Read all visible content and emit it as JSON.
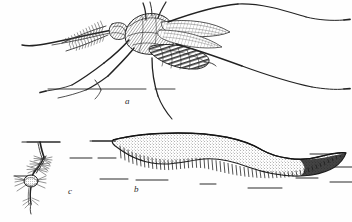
{
  "plate": {
    "title": "Mosquito life stages engraving plate",
    "background_color": "#fefefe",
    "ink_color": "#2b2b2b",
    "width": 352,
    "height": 222
  },
  "figures": [
    {
      "key": "a",
      "label": "a",
      "name": "adult-mosquito",
      "description": "Adult mosquito in side view with plumose antennae, long proboscis, banded abdomen, scaled wings and long trailing hind legs, resting on a surface line",
      "label_x": 125,
      "label_y": 97
    },
    {
      "key": "b",
      "label": "b",
      "name": "egg-raft",
      "description": "Boat-shaped mosquito egg raft floating on water, stippled upper surface and vertically striated egg columns, water surface indicated by short dashes",
      "label_x": 134,
      "label_y": 185
    },
    {
      "key": "c",
      "label": "c",
      "name": "mosquito-larva",
      "description": "Mosquito larva hanging head-down from the water surface by its breathing siphon, with bristled thorax and head",
      "label_x": 68,
      "label_y": 187
    }
  ],
  "labels": {
    "a": "a",
    "b": "b",
    "c": "c"
  }
}
